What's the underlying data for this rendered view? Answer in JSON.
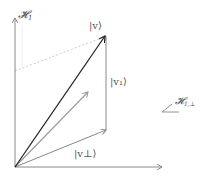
{
  "diagram": {
    "title": "",
    "labels": {
      "vertical_axis": "𝓗",
      "vertical_axis_sub": "1",
      "v": "|v⟩",
      "v1": "|v₁⟩",
      "v_perp": "|v⊥⟩",
      "plane": "𝓗",
      "plane_sub": "1,⊥"
    },
    "colors": {
      "axis": "#888888",
      "v_vector": "#222222",
      "gray_vector": "#999999",
      "dotted": "#cccccc",
      "label": "#555555"
    }
  }
}
